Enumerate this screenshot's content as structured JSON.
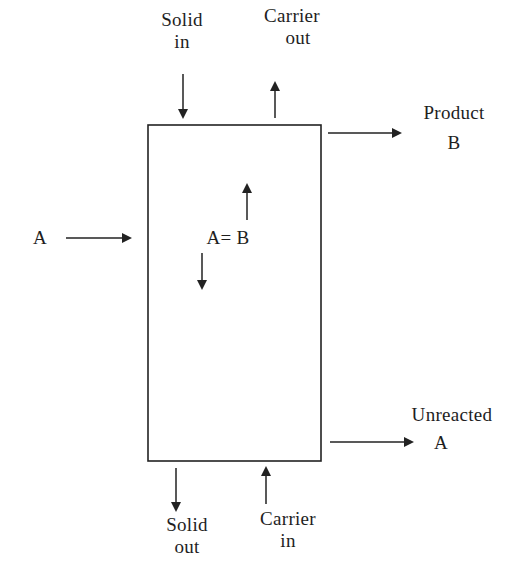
{
  "diagram": {
    "title": "",
    "colors": {
      "line": "#222222",
      "text": "#1e1e1e",
      "background": "#ffffff"
    },
    "reactor": {
      "x": 148,
      "y": 125,
      "width": 173,
      "height": 336
    },
    "labels": {
      "solid_in": {
        "line1": "Solid",
        "line2": "in"
      },
      "carrier_out": {
        "line1": "Carrier",
        "line2": "out"
      },
      "product": {
        "line1": "Product",
        "line2": "B"
      },
      "feed": {
        "text": "A"
      },
      "reaction": {
        "text": "A= B"
      },
      "unreacted": {
        "line1": "Unreacted",
        "line2": "A"
      },
      "solid_out": {
        "line1": "Solid",
        "line2": "out"
      },
      "carrier_in": {
        "line1": "Carrier",
        "line2": "in"
      }
    },
    "arrows": [
      {
        "name": "solid-in-arrow",
        "x1": 183,
        "y1": 74,
        "x2": 183,
        "y2": 117
      },
      {
        "name": "carrier-out-arrow",
        "x1": 275,
        "y1": 118,
        "x2": 275,
        "y2": 83
      },
      {
        "name": "product-arrow",
        "x1": 328,
        "y1": 133,
        "x2": 400,
        "y2": 133
      },
      {
        "name": "feed-arrow",
        "x1": 66,
        "y1": 238,
        "x2": 130,
        "y2": 238
      },
      {
        "name": "reaction-up-arrow",
        "x1": 247,
        "y1": 220,
        "x2": 247,
        "y2": 185
      },
      {
        "name": "reaction-down-arrow",
        "x1": 202,
        "y1": 253,
        "x2": 202,
        "y2": 288
      },
      {
        "name": "unreacted-arrow",
        "x1": 330,
        "y1": 442,
        "x2": 412,
        "y2": 442
      },
      {
        "name": "solid-out-arrow",
        "x1": 176,
        "y1": 468,
        "x2": 176,
        "y2": 510
      },
      {
        "name": "carrier-in-arrow",
        "x1": 266,
        "y1": 504,
        "x2": 266,
        "y2": 468
      }
    ]
  }
}
